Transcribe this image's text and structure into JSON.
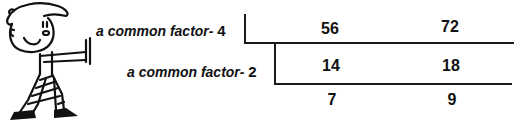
{
  "diagram": {
    "rows": [
      {
        "label_text": "a common factor-",
        "divisor": "4",
        "values": [
          "56",
          "72"
        ]
      },
      {
        "label_text": "a common factor-",
        "divisor": "2",
        "values": [
          "14",
          "18"
        ]
      },
      {
        "label_text": "",
        "divisor": "",
        "values": [
          "7",
          "9"
        ]
      }
    ],
    "illustration": "cartoon-boy-pushing"
  }
}
